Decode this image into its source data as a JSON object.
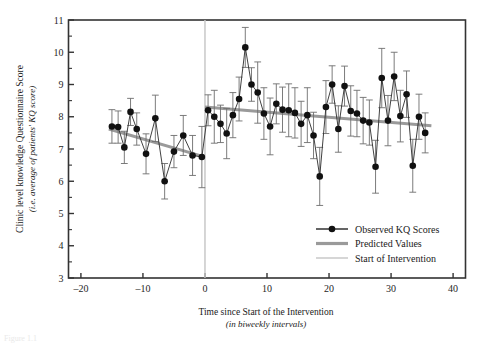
{
  "figure": {
    "caption_fragment": "Figure 1.1"
  },
  "chart_data": {
    "type": "scatter",
    "title": "",
    "xlabel": "Time since Start of the Intervention",
    "xlabel_sub": "(in biweekly intervals)",
    "ylabel": "Clinic level knowledge Questionnaire Score",
    "ylabel_sub": "(i.e. average of patients' KQ score)",
    "xlim": [
      -22,
      42
    ],
    "ylim": [
      3,
      11
    ],
    "xticks": [
      -20,
      -10,
      0,
      10,
      20,
      30,
      40
    ],
    "xtick_labels": [
      "–20",
      "–10",
      "0",
      "10",
      "20",
      "30",
      "40"
    ],
    "yticks": [
      3,
      4,
      5,
      6,
      7,
      8,
      9,
      10,
      11
    ],
    "ytick_labels": [
      "3",
      "4",
      "5",
      "6",
      "7",
      "8",
      "9",
      "10",
      "11"
    ],
    "y_minor_step": 0.5,
    "grid": false,
    "legend_position": "lower-right-inside",
    "colors": {
      "observed": "#111111",
      "predicted": "#9a9a9a",
      "intervention": "#c8c8c8",
      "frame": "#333333",
      "errorbar": "#6d6d6d"
    },
    "intervention_x": 0,
    "series": [
      {
        "name": "Observed KQ Scores",
        "marker": "filled-circle",
        "x": [
          -15.0,
          -14.0,
          -13.0,
          -12.0,
          -11.0,
          -9.5,
          -8.0,
          -6.5,
          -5.0,
          -3.5,
          -2.0,
          -0.5,
          0.5,
          1.5,
          2.5,
          3.5,
          4.5,
          5.5,
          6.5,
          7.5,
          8.5,
          9.5,
          10.5,
          11.5,
          12.5,
          13.5,
          14.5,
          15.5,
          16.5,
          17.5,
          18.5,
          19.5,
          20.5,
          21.5,
          22.5,
          23.5,
          24.5,
          25.5,
          26.5,
          27.5,
          28.5,
          29.5,
          30.5,
          31.5,
          32.5,
          33.5,
          34.5,
          35.5
        ],
        "y": [
          7.7,
          7.68,
          7.05,
          8.15,
          7.62,
          6.85,
          7.95,
          6.0,
          6.92,
          7.42,
          6.8,
          6.75,
          8.2,
          8.0,
          7.78,
          7.48,
          8.05,
          8.55,
          10.15,
          9.0,
          8.75,
          8.1,
          7.7,
          8.4,
          8.22,
          8.2,
          8.12,
          7.78,
          8.05,
          7.42,
          6.15,
          8.3,
          9.0,
          7.62,
          8.95,
          8.18,
          8.1,
          7.88,
          7.82,
          6.45,
          9.2,
          7.88,
          9.25,
          8.02,
          8.7,
          6.48,
          8.0,
          7.5
        ],
        "yerr": [
          0.52,
          0.5,
          0.5,
          0.42,
          0.5,
          0.62,
          0.72,
          0.55,
          0.5,
          0.62,
          0.62,
          0.95,
          0.48,
          0.82,
          0.58,
          0.78,
          0.7,
          0.68,
          0.62,
          0.52,
          0.95,
          0.8,
          0.88,
          0.62,
          0.7,
          0.82,
          0.78,
          0.7,
          0.85,
          0.72,
          0.9,
          0.82,
          0.58,
          0.72,
          0.62,
          0.78,
          0.72,
          0.72,
          0.7,
          0.82,
          0.92,
          0.78,
          0.75,
          0.8,
          0.72,
          0.82,
          0.7,
          0.62
        ]
      }
    ],
    "predicted_segments": [
      {
        "name": "pre-intervention",
        "x": [
          -15.5,
          -0.5
        ],
        "y": [
          7.62,
          6.78
        ]
      },
      {
        "name": "post-intervention",
        "x": [
          0.0,
          36.5
        ],
        "y": [
          8.3,
          7.72
        ]
      }
    ],
    "annotations": []
  },
  "legend": {
    "items": [
      {
        "label": "Observed KQ Scores",
        "style": "line-with-marker",
        "color": "#111111"
      },
      {
        "label": "Predicted Values",
        "style": "thick-line",
        "color": "#9a9a9a"
      },
      {
        "label": "Start of Intervention",
        "style": "thin-line",
        "color": "#c8c8c8"
      }
    ]
  }
}
